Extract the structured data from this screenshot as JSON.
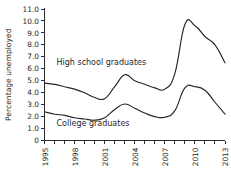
{
  "chart_data": {
    "type": "line",
    "title": "",
    "xlabel": "",
    "ylabel": "Percentage unemployed",
    "x": [
      1995,
      1996,
      1997,
      1998,
      1999,
      2000,
      2001,
      2002,
      2003,
      2004,
      2005,
      2006,
      2007,
      2008,
      2009,
      2010,
      2011,
      2012,
      2013
    ],
    "xlim": [
      1995,
      2013
    ],
    "ylim": [
      0,
      11.0
    ],
    "grid": false,
    "legend_position": "inline-annotations",
    "xticks": [
      1995,
      1996,
      1997,
      1998,
      1999,
      2000,
      2001,
      2002,
      2003,
      2004,
      2005,
      2006,
      2007,
      2008,
      2009,
      2010,
      2011,
      2012,
      2013
    ],
    "xtick_labels": [
      "1995",
      "",
      "",
      "1998",
      "",
      "",
      "2001",
      "",
      "",
      "2004",
      "",
      "",
      "2007",
      "",
      "",
      "2010",
      "",
      "",
      "2013"
    ],
    "xtick_labels_shown": [
      "1995",
      "1998",
      "2001",
      "2004",
      "2007",
      "2010",
      "2013"
    ],
    "yticks": [
      0,
      1.0,
      2.0,
      3.0,
      4.0,
      5.0,
      6.0,
      7.0,
      8.0,
      9.0,
      10.0,
      11.0
    ],
    "ytick_labels": [
      "0",
      "1.0",
      "2.0",
      "3.0",
      "4.0",
      "5.0",
      "6.0",
      "7.0",
      "8.0",
      "9.0",
      "10.0",
      "11.0"
    ],
    "series": [
      {
        "name": "High school graduates",
        "color": "#262626",
        "label_x": 1996.2,
        "label_y": 6.35,
        "values": [
          4.8,
          4.7,
          4.5,
          4.3,
          4.0,
          3.6,
          3.5,
          4.5,
          5.5,
          5.0,
          4.7,
          4.4,
          4.3,
          5.6,
          9.7,
          9.6,
          8.7,
          8.0,
          6.5
        ]
      },
      {
        "name": "College graduates",
        "color": "#262626",
        "label_x": 1996.2,
        "label_y": 1.25,
        "values": [
          2.4,
          2.2,
          2.1,
          1.9,
          1.8,
          1.7,
          1.9,
          2.6,
          3.05,
          2.7,
          2.3,
          2.0,
          1.95,
          2.5,
          4.4,
          4.5,
          4.2,
          3.2,
          2.2
        ]
      }
    ]
  },
  "axis": {
    "y_title": "Percentage unemployed"
  }
}
